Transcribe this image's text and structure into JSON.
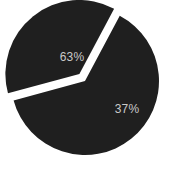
{
  "chart_data": {
    "type": "pie",
    "title": "",
    "subtitle": "",
    "xlabel": "",
    "ylabel": "",
    "grid": false,
    "legend_position": "none",
    "units": "percent",
    "total": 100,
    "categories": [
      "Segment A",
      "Segment B"
    ],
    "values": [
      63,
      37
    ],
    "data_labels": [
      "63%",
      "37%"
    ],
    "series": [
      {
        "name": "Share",
        "values": [
          63,
          37
        ]
      }
    ],
    "slices": [
      {
        "label": "63%",
        "value": 63,
        "color": "#1f1f1f",
        "exploded": false,
        "label_x": 72,
        "label_y": 58
      },
      {
        "label": "37%",
        "value": 37,
        "color": "#1f1f1f",
        "exploded": true,
        "label_x": 127,
        "label_y": 110
      }
    ],
    "annotations": []
  },
  "style": {
    "background_color": "#ffffff",
    "slice_color": "#1f1f1f",
    "separator_color": "#ffffff",
    "label_color": "#c9c9c9"
  },
  "geometry": {
    "center_x": 85,
    "center_y": 81,
    "radius": 74,
    "start_angle_deg": -62,
    "explode_offset": 9
  }
}
